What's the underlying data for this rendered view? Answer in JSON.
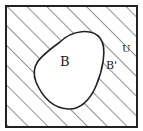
{
  "diagram": {
    "type": "venn-complement",
    "universe_label": "U",
    "set_label": "B",
    "complement_label": "B'",
    "colors": {
      "line": "#222222",
      "background": "#ffffff",
      "hatch": "#333333"
    }
  }
}
